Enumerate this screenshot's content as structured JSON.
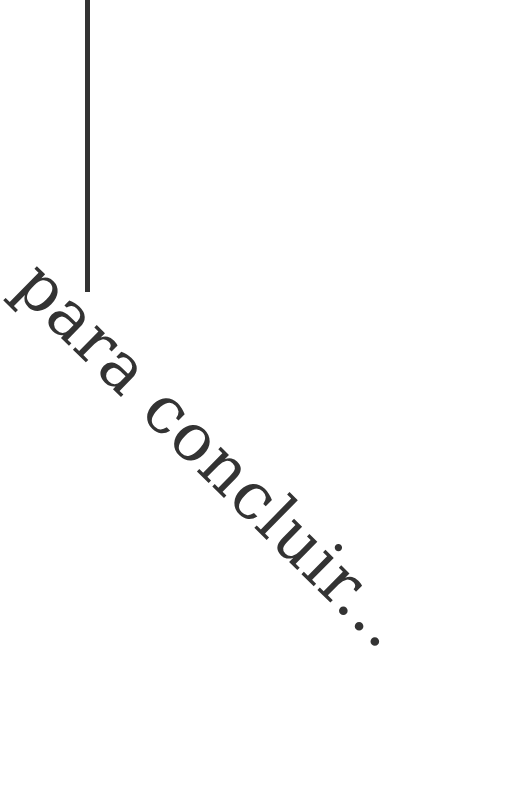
{
  "title": "para concluir...",
  "colors": {
    "text": "#333333",
    "line": "#333333",
    "background": "#ffffff"
  }
}
